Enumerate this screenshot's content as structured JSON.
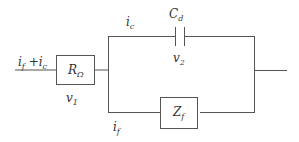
{
  "diagram": {
    "type": "circuit",
    "colors": {
      "wire": "#555555",
      "text": "#333333",
      "background": "#ffffff"
    },
    "input_current": {
      "base": "i",
      "sub1": "f",
      "op": " +",
      "base2": "i",
      "sub2": "c"
    },
    "resistor": {
      "base": "R",
      "sub": "Ω",
      "voltage_base": "v",
      "voltage_sub": "1"
    },
    "capacitor": {
      "base": "C",
      "sub": "d",
      "voltage_base": "v",
      "voltage_sub": "2",
      "current_base": "i",
      "current_sub": "c"
    },
    "impedance": {
      "base": "Z",
      "sub": "f",
      "current_base": "i",
      "current_sub": "f"
    }
  }
}
